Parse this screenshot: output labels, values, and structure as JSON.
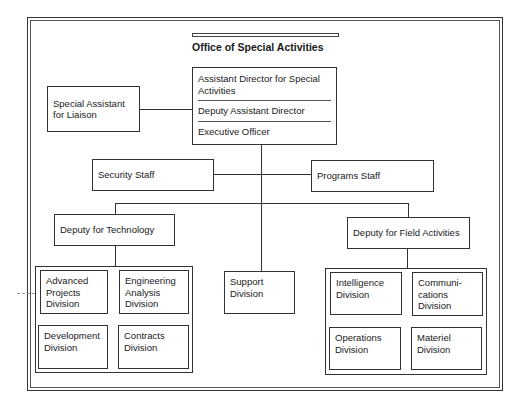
{
  "chart": {
    "title": "Office of Special Activities",
    "head": {
      "roles": [
        "Assistant Director for Special Activities",
        "Deputy Assistant Director",
        "Executive Officer"
      ]
    },
    "liaison": "Special Assistant for Liaison",
    "staff": {
      "left": "Security Staff",
      "right": "Programs Staff"
    },
    "deputies": {
      "technology": "Deputy for Technology",
      "field": "Deputy for Field Activities"
    },
    "support": "Support Division",
    "technology_divisions": [
      "Advanced Projects Division",
      "Engineering Analysis Division",
      "Development Division",
      "Contracts Division"
    ],
    "field_divisions": [
      "Intelligence Division",
      "Communi- cations Division",
      "Operations Division",
      "Materiel Division"
    ]
  },
  "colors": {
    "line": "#333333",
    "background": "#ffffff"
  }
}
